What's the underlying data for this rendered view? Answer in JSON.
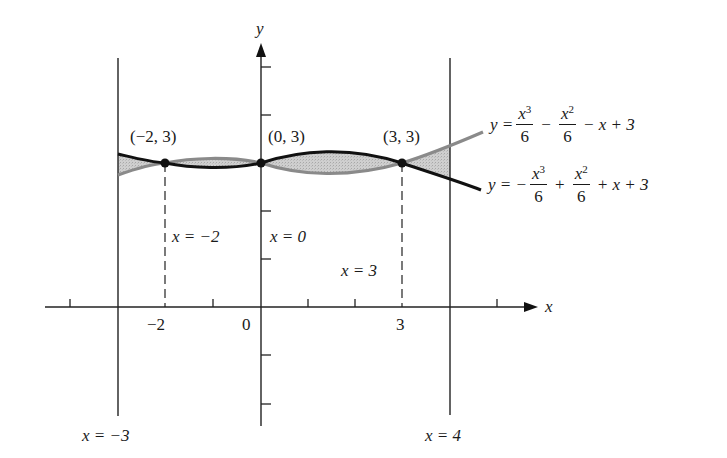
{
  "axes": {
    "x_label": "x",
    "y_label": "y",
    "x_tick_labels": [
      {
        "value": -2,
        "text": "−2"
      },
      {
        "value": 0,
        "text": "0"
      },
      {
        "value": 3,
        "text": "3"
      }
    ]
  },
  "points": [
    {
      "label": "(−2, 3)",
      "x": -2,
      "y": 3
    },
    {
      "label": "(0, 3)",
      "x": 0,
      "y": 3
    },
    {
      "label": "(3, 3)",
      "x": 3,
      "y": 3
    }
  ],
  "vertical_lines": {
    "solid": [
      {
        "label": "x = −3",
        "x": -3
      },
      {
        "label": "x = 4",
        "x": 4
      }
    ],
    "dashed": [
      {
        "label": "x = −2",
        "x": -2
      },
      {
        "label": "x = 0",
        "x": 0
      },
      {
        "label": "x = 3",
        "x": 3
      }
    ]
  },
  "curves": {
    "gray": {
      "prefix": "y =",
      "term1_num": "x",
      "term1_exp": "3",
      "term1_den": "6",
      "op1": "−",
      "term2_num": "x",
      "term2_exp": "2",
      "term2_den": "6",
      "rest": "− x + 3",
      "color": "#8a8a8a"
    },
    "black": {
      "prefix": "y = −",
      "term1_num": "x",
      "term1_exp": "3",
      "term1_den": "6",
      "op1": "+",
      "term2_num": "x",
      "term2_exp": "2",
      "term2_den": "6",
      "rest": "+ x + 3",
      "color": "#111111"
    }
  },
  "shading_color": "#c9c9c9"
}
